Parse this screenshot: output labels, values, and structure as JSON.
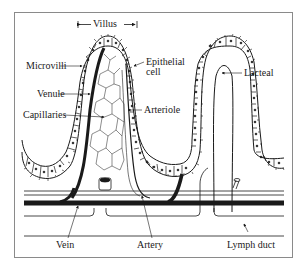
{
  "diagram": {
    "colors": {
      "ink": "#1a1a1a",
      "frame": "#8a8a8a",
      "background": "#ffffff"
    },
    "labels": {
      "villus": "Villus",
      "microvilli": "Microvilli",
      "epithelial_cell_line1": "Epithelial",
      "epithelial_cell_line2": "cell",
      "venule": "Venule",
      "arteriole": "Arteriole",
      "capillaries": "Capillaries",
      "lacteal": "Lacteal",
      "vein": "Vein",
      "artery": "Artery",
      "lymph_duct": "Lymph duct"
    }
  }
}
